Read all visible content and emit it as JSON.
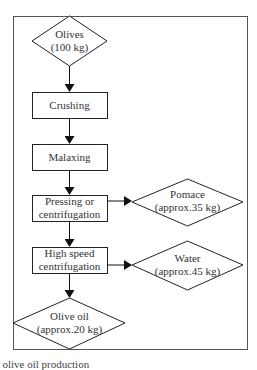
{
  "diagram": {
    "type": "flowchart",
    "nodes": [
      {
        "id": "olives",
        "shape": "diamond",
        "line1": "Olives",
        "line2": "(100 kg)"
      },
      {
        "id": "crushing",
        "shape": "rect",
        "line1": "Crushing"
      },
      {
        "id": "malaxing",
        "shape": "rect",
        "line1": "Malaxing"
      },
      {
        "id": "pressing",
        "shape": "rect",
        "line1": "Pressing or",
        "line2": "centrifugation"
      },
      {
        "id": "pomace",
        "shape": "diamond",
        "line1": "Pomace",
        "line2": "(approx.35 kg)"
      },
      {
        "id": "highspeed",
        "shape": "rect",
        "line1": "High speed",
        "line2": "centrifugation"
      },
      {
        "id": "water",
        "shape": "diamond",
        "line1": "Water",
        "line2": "(approx.45 kg)"
      },
      {
        "id": "oliveoil",
        "shape": "diamond",
        "line1": "Olive oil",
        "line2": "(approx.20 kg)"
      }
    ],
    "edges": [
      [
        "olives",
        "crushing"
      ],
      [
        "crushing",
        "malaxing"
      ],
      [
        "malaxing",
        "pressing"
      ],
      [
        "pressing",
        "pomace"
      ],
      [
        "pressing",
        "highspeed"
      ],
      [
        "highspeed",
        "water"
      ],
      [
        "highspeed",
        "oliveoil"
      ]
    ],
    "caption": "f olive oil production"
  }
}
